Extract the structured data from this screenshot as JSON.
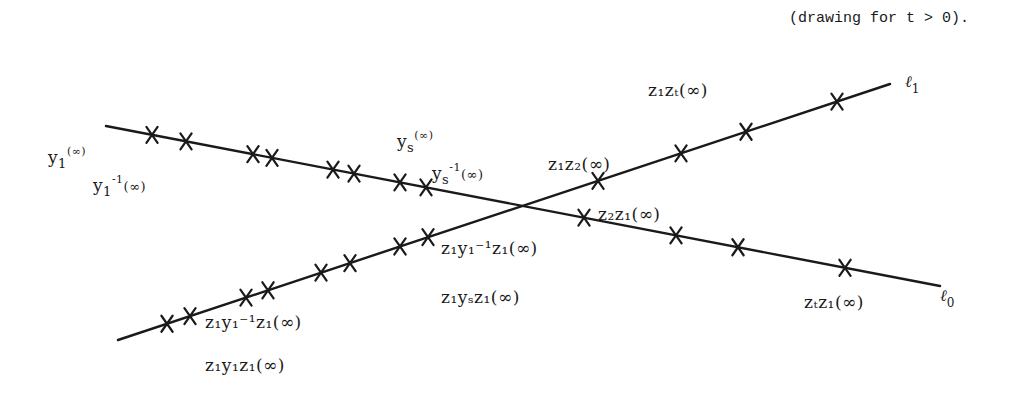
{
  "caption": "(drawing for t > 0).",
  "colors": {
    "ink": "#1a1a1a",
    "background": "#ffffff"
  },
  "lines": {
    "l0": {
      "name": "ℓ",
      "sub": "0",
      "start": [
        106,
        126
      ],
      "end": [
        940,
        286
      ]
    },
    "l1": {
      "name": "ℓ",
      "sub": "1",
      "start": [
        118,
        340
      ],
      "end": [
        890,
        84
      ]
    }
  },
  "markers": {
    "l0_x": [
      152,
      186,
      253,
      272,
      333,
      354,
      400,
      426,
      584,
      676,
      738,
      845
    ],
    "l1_x": [
      167,
      190,
      246,
      268,
      321,
      350,
      400,
      428,
      598,
      681,
      746,
      837
    ]
  },
  "labels": {
    "y1": {
      "base": "y",
      "sub": "1",
      "sup": "",
      "tail": "(∞)"
    },
    "y1inv": {
      "base": "y",
      "sub": "1",
      "sup": "-1",
      "tail": "(∞)"
    },
    "ys": {
      "base": "y",
      "sub": "s",
      "sup": "",
      "tail": "(∞)"
    },
    "ysinv": {
      "base": "y",
      "sub": "s",
      "sup": "-1",
      "tail": "(∞)"
    },
    "z1z2": {
      "text": "z₁z₂(∞)"
    },
    "z1zt": {
      "text": "z₁zₜ(∞)"
    },
    "z2z1": {
      "text": "z₂z₁(∞)"
    },
    "ztz1": {
      "text": "zₜz₁(∞)"
    },
    "z1y1invz1_upper": {
      "text": "z₁y₁⁻¹z₁(∞)"
    },
    "z1y1invz1_lower": {
      "text": "z₁y₁⁻¹z₁(∞)"
    },
    "z1ysz1": {
      "text": "z₁yₛz₁(∞)"
    },
    "z1y1z1": {
      "text": "z₁y₁z₁(∞)"
    }
  }
}
